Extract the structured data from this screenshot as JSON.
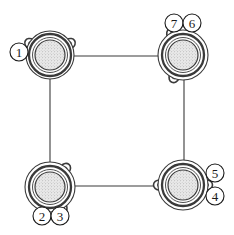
{
  "diagram": {
    "type": "line-drawing",
    "background_color": "#ffffff",
    "line_color": "#3a3a3a",
    "ink_color": "#1a1a1a",
    "fill_color": "#e8e8e8",
    "canvas": {
      "width": 234,
      "height": 235
    },
    "nodes": [
      {
        "id": "node-top-left",
        "name": "connector-top-left",
        "cx": 50,
        "cy": 55,
        "r_outer": 24,
        "r_ring": 21,
        "r_inner": 15,
        "lugs": [
          {
            "angle": 150,
            "rx": 6,
            "ry": 5
          },
          {
            "angle": 30,
            "rx": 6,
            "ry": 5
          }
        ]
      },
      {
        "id": "node-top-right",
        "name": "connector-top-right",
        "cx": 183,
        "cy": 55,
        "r_outer": 25,
        "r_ring": 21,
        "r_inner": 15,
        "lugs": [
          {
            "angle": 248,
            "rx": 6,
            "ry": 5
          },
          {
            "angle": 118,
            "rx": 6,
            "ry": 5
          }
        ]
      },
      {
        "id": "node-bottom-left",
        "name": "connector-bottom-left",
        "cx": 50,
        "cy": 187,
        "r_outer": 25,
        "r_ring": 21,
        "r_inner": 15,
        "lugs": [
          {
            "angle": 300,
            "rx": 6,
            "ry": 5
          },
          {
            "angle": 50,
            "rx": 6,
            "ry": 5
          }
        ]
      },
      {
        "id": "node-bottom-right",
        "name": "connector-bottom-right",
        "cx": 183,
        "cy": 185,
        "r_outer": 25,
        "r_ring": 21,
        "r_inner": 15,
        "lugs": [
          {
            "angle": 180,
            "rx": 6,
            "ry": 5
          },
          {
            "angle": 0,
            "rx": 6,
            "ry": 5
          }
        ]
      }
    ],
    "connectors": [
      {
        "id": "link-top",
        "name": "link-top-horizontal",
        "x1": 73,
        "y1": 56,
        "x2": 161,
        "y2": 56
      },
      {
        "id": "link-left",
        "name": "link-left-vertical",
        "x1": 50,
        "y1": 78,
        "x2": 50,
        "y2": 164
      },
      {
        "id": "link-right",
        "name": "link-right-vertical",
        "x1": 184,
        "y1": 79,
        "x2": 184,
        "y2": 162
      },
      {
        "id": "link-bottom",
        "name": "link-bottom-horizontal",
        "x1": 73,
        "y1": 186,
        "x2": 160,
        "y2": 186
      }
    ],
    "callouts": [
      {
        "id": "callout-1",
        "name": "callout-1",
        "label": "1",
        "cx": 19,
        "cy": 52,
        "r": 9
      },
      {
        "id": "callout-7",
        "name": "callout-7",
        "label": "7",
        "cx": 174,
        "cy": 23,
        "r": 9
      },
      {
        "id": "callout-6",
        "name": "callout-6",
        "label": "6",
        "cx": 192,
        "cy": 23,
        "r": 9
      },
      {
        "id": "callout-2",
        "name": "callout-2",
        "label": "2",
        "cx": 42,
        "cy": 216,
        "r": 9
      },
      {
        "id": "callout-3",
        "name": "callout-3",
        "label": "3",
        "cx": 60,
        "cy": 216,
        "r": 9
      },
      {
        "id": "callout-5",
        "name": "callout-5",
        "label": "5",
        "cx": 215,
        "cy": 173,
        "r": 9
      },
      {
        "id": "callout-4",
        "name": "callout-4",
        "label": "4",
        "cx": 215,
        "cy": 196,
        "r": 9
      }
    ]
  }
}
